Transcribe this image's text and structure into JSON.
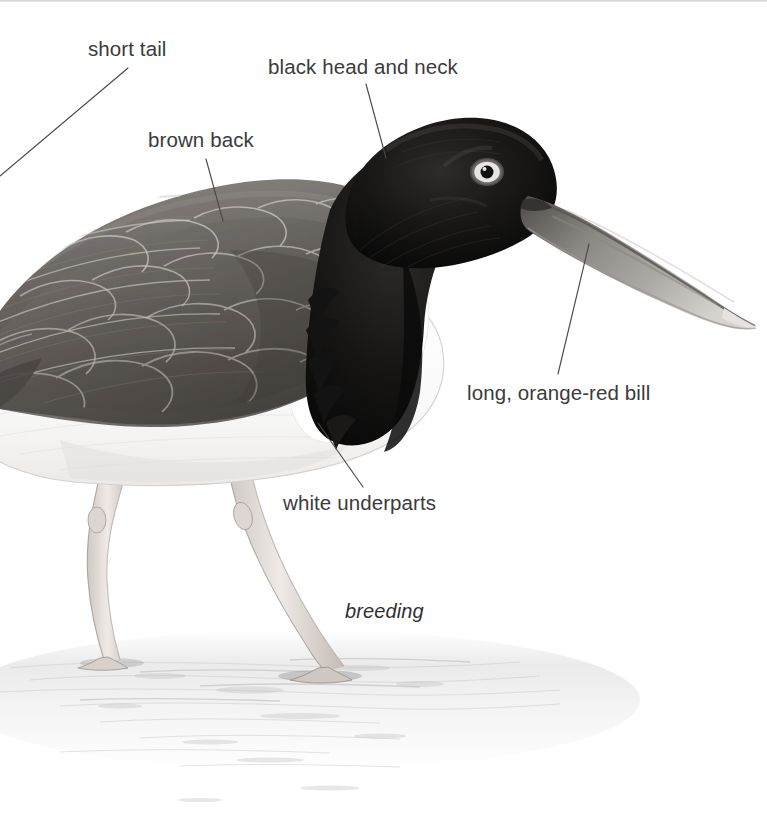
{
  "plate": {
    "subject": "American Oystercatcher",
    "plumage_caption": "breeding",
    "background_color": "#ffffff",
    "label_color": "#3b3b3b",
    "leader_line_color": "#4a4a4a"
  },
  "labels": [
    {
      "id": "short-tail",
      "text": "short tail",
      "x": 88,
      "y": 38
    },
    {
      "id": "black-head-and-neck",
      "text": "black head and neck",
      "x": 268,
      "y": 56
    },
    {
      "id": "brown-back",
      "text": "brown back",
      "x": 148,
      "y": 129
    },
    {
      "id": "long-orange-red-bill",
      "text": "long, orange-red bill",
      "x": 467,
      "y": 382
    },
    {
      "id": "white-underparts",
      "text": "white underparts",
      "x": 283,
      "y": 492
    }
  ],
  "caption": {
    "text": "breeding",
    "x": 345,
    "y": 600
  },
  "leaders": [
    {
      "id": "leader-short-tail",
      "x1": 128,
      "y1": 68,
      "x2": 0,
      "y2": 176
    },
    {
      "id": "leader-black-head-and-neck",
      "x1": 366,
      "y1": 84,
      "x2": 386,
      "y2": 158
    },
    {
      "id": "leader-brown-back",
      "x1": 206,
      "y1": 159,
      "x2": 223,
      "y2": 221
    },
    {
      "id": "leader-long-orange-red-bill",
      "x1": 589,
      "y1": 244,
      "x2": 558,
      "y2": 374
    },
    {
      "id": "leader-white-underparts",
      "x1": 318,
      "y1": 423,
      "x2": 363,
      "y2": 487
    }
  ],
  "bird_parts": {
    "tail": "short tail",
    "back": "brown back",
    "head": "black head and neck",
    "bill": "long, orange-red bill",
    "underparts": "white underparts",
    "legs": "pale pink legs",
    "eye": "yellow eye with orange orbital ring"
  },
  "colors": {
    "head_black": "#1a1a1a",
    "back_brown": "#6f6b67",
    "bill_gray": "#7e7a77",
    "underparts_white": "#fdfdfd",
    "leg_pink": "#d9d2cd",
    "ground_gray": "#d7d7d7"
  }
}
